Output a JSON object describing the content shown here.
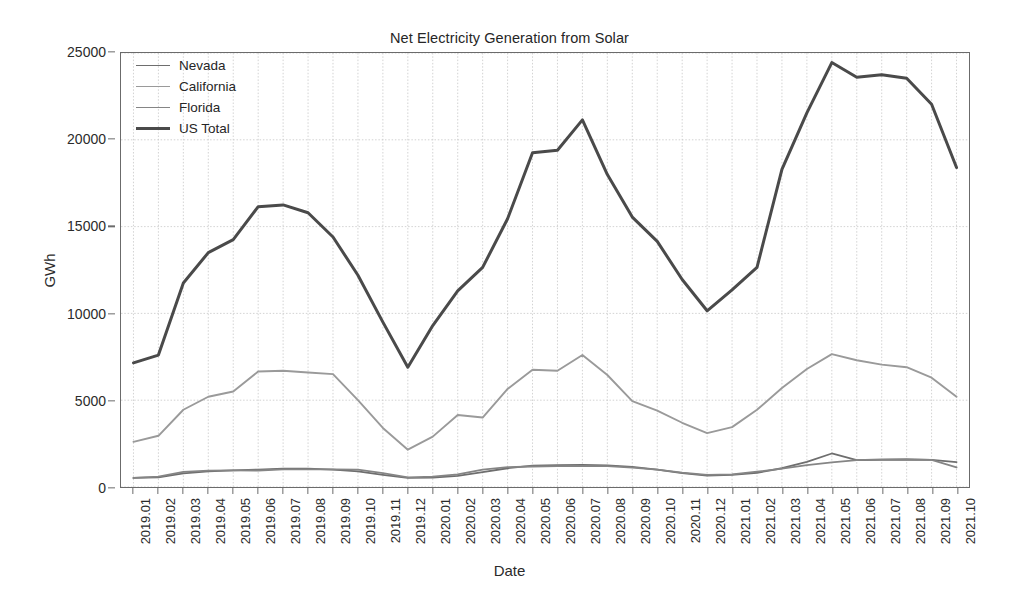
{
  "chart_data": {
    "type": "line",
    "title": "Net Electricity Generation from Solar",
    "xlabel": "Date",
    "ylabel": "GWh",
    "ylim": [
      0,
      25000
    ],
    "yticks": [
      0,
      5000,
      10000,
      15000,
      20000,
      25000
    ],
    "ytick_labels": [
      "0",
      "5000",
      "10000",
      "15000",
      "20000",
      "25000"
    ],
    "grid": true,
    "legend_position": "upper left",
    "x": [
      "2019.01",
      "2019.02",
      "2019.03",
      "2019.04",
      "2019.05",
      "2019.06",
      "2019.07",
      "2019.08",
      "2019.09",
      "2019.10",
      "2019.11",
      "2019.12",
      "2020.01",
      "2020.02",
      "2020.03",
      "2020.04",
      "2020.05",
      "2020.06",
      "2020.07",
      "2020.08",
      "2020.09",
      "2020.10",
      "2020.11",
      "2020.12",
      "2021.01",
      "2021.02",
      "2021.03",
      "2021.04",
      "2021.05",
      "2021.06",
      "2021.07",
      "2021.08",
      "2021.09",
      "2021.10"
    ],
    "series": [
      {
        "name": "Nevada",
        "color": "#6e6e6e",
        "width": 1.8,
        "values": [
          520,
          560,
          780,
          900,
          960,
          1000,
          1050,
          1060,
          1000,
          900,
          700,
          520,
          540,
          640,
          860,
          1080,
          1230,
          1260,
          1270,
          1250,
          1160,
          1000,
          800,
          660,
          700,
          820,
          1080,
          1450,
          1930,
          1550,
          1560,
          1570,
          1560,
          1430
        ]
      },
      {
        "name": "California",
        "color": "#9a9a9a",
        "width": 1.9,
        "values": [
          2600,
          2950,
          4450,
          5200,
          5500,
          6650,
          6700,
          6600,
          6500,
          5000,
          3400,
          2150,
          2900,
          4150,
          4000,
          5650,
          6750,
          6700,
          7600,
          6450,
          4950,
          4400,
          3700,
          3100,
          3450,
          4450,
          5700,
          6800,
          7650,
          7300,
          7050,
          6900,
          6300,
          5200
        ]
      },
      {
        "name": "Florida",
        "color": "#858585",
        "width": 1.8,
        "values": [
          520,
          600,
          870,
          940,
          960,
          950,
          1020,
          1020,
          1020,
          1000,
          800,
          560,
          600,
          730,
          1000,
          1140,
          1180,
          1200,
          1220,
          1200,
          1120,
          1000,
          830,
          700,
          730,
          880,
          1060,
          1260,
          1420,
          1550,
          1590,
          1600,
          1560,
          1130
        ]
      },
      {
        "name": "US Total",
        "color": "#4a4a4a",
        "width": 3.0,
        "values": [
          7150,
          7600,
          11750,
          13500,
          14250,
          16150,
          16250,
          15800,
          14400,
          12200,
          9500,
          6900,
          9300,
          11300,
          12650,
          15450,
          19250,
          19400,
          21150,
          18000,
          15550,
          14150,
          11950,
          10150,
          11350,
          12650,
          18300,
          21550,
          24450,
          23600,
          23750,
          23550,
          22050,
          18400
        ]
      }
    ]
  },
  "legend": {
    "items": [
      {
        "label": "Nevada"
      },
      {
        "label": "California"
      },
      {
        "label": "Florida"
      },
      {
        "label": "US Total"
      }
    ]
  }
}
